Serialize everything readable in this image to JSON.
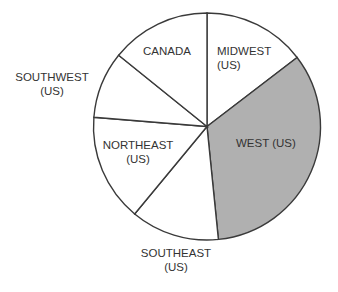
{
  "chart_data": {
    "type": "pie",
    "title": "",
    "start_angle_deg": 0,
    "direction": "clockwise",
    "slices": [
      {
        "label": "MIDWEST (US)",
        "line1": "MIDWEST",
        "line2": "(US)",
        "percent": 14.6,
        "color": "#ffffff"
      },
      {
        "label": "WEST (US)",
        "line1": "WEST (US)",
        "line2": "",
        "percent": 33.8,
        "color": "#b0b0b0"
      },
      {
        "label": "SOUTHEAST (US)",
        "line1": "SOUTHEAST",
        "line2": "(US)",
        "percent": 12.6,
        "color": "#ffffff"
      },
      {
        "label": "NORTHEAST (US)",
        "line1": "NORTHEAST",
        "line2": "(US)",
        "percent": 15.3,
        "color": "#ffffff"
      },
      {
        "label": "SOUTHWEST (US)",
        "line1": "SOUTHWEST",
        "line2": "(US)",
        "percent": 9.5,
        "color": "#ffffff"
      },
      {
        "label": "CANADA",
        "line1": "CANADA",
        "line2": "",
        "percent": 14.2,
        "color": "#ffffff"
      }
    ],
    "highlighted": "WEST (US)",
    "legend": "none"
  }
}
